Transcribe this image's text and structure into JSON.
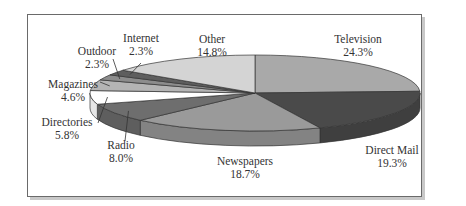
{
  "chart_data": {
    "type": "pie",
    "style": "3d-pie",
    "title": "",
    "slices": [
      {
        "label": "Television",
        "value": 24.3,
        "value_label": "24.3%",
        "color": "#a9a9a9"
      },
      {
        "label": "Direct Mail",
        "value": 19.3,
        "value_label": "19.3%",
        "color": "#4a4a4a"
      },
      {
        "label": "Newspapers",
        "value": 18.7,
        "value_label": "18.7%",
        "color": "#9a9a9a"
      },
      {
        "label": "Radio",
        "value": 8.0,
        "value_label": "8.0%",
        "color": "#6e6e6e"
      },
      {
        "label": "Directories",
        "value": 5.8,
        "value_label": "5.8%",
        "color": "#ffffff"
      },
      {
        "label": "Magazines",
        "value": 4.6,
        "value_label": "4.6%",
        "color": "#b4b4b4"
      },
      {
        "label": "Outdoor",
        "value": 2.3,
        "value_label": "2.3%",
        "color": "#8c8c8c"
      },
      {
        "label": "Internet",
        "value": 2.3,
        "value_label": "2.3%",
        "color": "#5e5e5e"
      },
      {
        "label": "Other",
        "value": 14.8,
        "value_label": "14.8%",
        "color": "#d4d4d4"
      }
    ],
    "legend": "none",
    "labels_position": "outside-with-leader-lines"
  }
}
